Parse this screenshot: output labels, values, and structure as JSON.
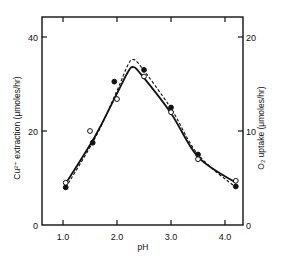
{
  "chart_data": {
    "type": "line",
    "title": "",
    "xlabel": "pH",
    "ylabel": "Cu²⁺ extraction (μmoles/hr)",
    "ylabel_right": "O₂ uptake (μmoles/hr)",
    "xlim": [
      0.6,
      4.33
    ],
    "ylim": [
      0,
      44
    ],
    "ylim_right": [
      0,
      22
    ],
    "xticks": [
      1.0,
      2.0,
      3.0,
      4.0
    ],
    "xtick_labels": [
      "1.0",
      "2.0",
      "3.0",
      "4.0"
    ],
    "yticks": [
      0,
      20,
      40
    ],
    "ytick_labels": [
      "0",
      "20",
      "40"
    ],
    "yticks_right": [
      0,
      10,
      20
    ],
    "ytick_labels_right": [
      "0",
      "10",
      "20"
    ],
    "grid": false,
    "legend": null,
    "series": [
      {
        "name": "Cu²⁺ extraction",
        "axis": "left",
        "marker": "filled-circle",
        "line": "solid",
        "points": [
          {
            "x": 1.05,
            "y": 8.0
          },
          {
            "x": 1.55,
            "y": 17.5
          },
          {
            "x": 1.95,
            "y": 30.5
          },
          {
            "x": 2.5,
            "y": 33.0
          },
          {
            "x": 3.0,
            "y": 25.0
          },
          {
            "x": 3.5,
            "y": 15.0
          },
          {
            "x": 4.2,
            "y": 8.2
          }
        ],
        "curve": [
          {
            "x": 1.05,
            "y": 8.8
          },
          {
            "x": 1.6,
            "y": 19.0
          },
          {
            "x": 2.0,
            "y": 28.0
          },
          {
            "x": 2.2,
            "y": 32.5
          },
          {
            "x": 2.3,
            "y": 33.6
          },
          {
            "x": 2.45,
            "y": 32.0
          },
          {
            "x": 3.0,
            "y": 23.8
          },
          {
            "x": 3.5,
            "y": 14.5
          },
          {
            "x": 4.2,
            "y": 9.0
          }
        ]
      },
      {
        "name": "O₂ uptake",
        "axis": "right",
        "marker": "open-circle",
        "line": "dashed",
        "points": [
          {
            "x": 1.05,
            "y": 4.5
          },
          {
            "x": 1.5,
            "y": 10.0
          },
          {
            "x": 2.0,
            "y": 13.4
          },
          {
            "x": 2.5,
            "y": 15.8
          },
          {
            "x": 3.0,
            "y": 12.0
          },
          {
            "x": 3.5,
            "y": 7.0
          },
          {
            "x": 4.2,
            "y": 4.7
          }
        ],
        "curve": [
          {
            "x": 1.05,
            "y": 4.0
          },
          {
            "x": 1.6,
            "y": 9.3
          },
          {
            "x": 2.0,
            "y": 14.3
          },
          {
            "x": 2.2,
            "y": 17.0
          },
          {
            "x": 2.3,
            "y": 17.6
          },
          {
            "x": 2.45,
            "y": 16.8
          },
          {
            "x": 3.0,
            "y": 12.4
          },
          {
            "x": 3.5,
            "y": 7.5
          },
          {
            "x": 4.2,
            "y": 4.0
          }
        ]
      }
    ]
  }
}
